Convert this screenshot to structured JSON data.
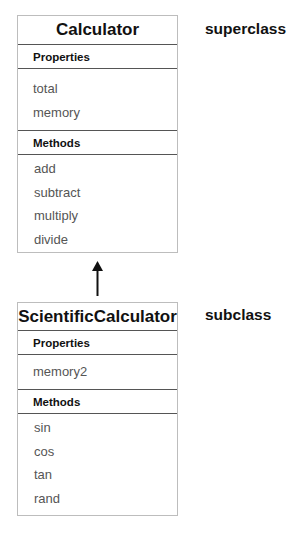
{
  "superclass": {
    "label": "superclass",
    "name": "Calculator",
    "properties_header": "Properties",
    "properties": [
      "total",
      "memory"
    ],
    "methods_header": "Methods",
    "methods": [
      "add",
      "subtract",
      "multiply",
      "divide"
    ]
  },
  "subclass": {
    "label": "subclass",
    "name": "ScientificCalculator",
    "properties_header": "Properties",
    "properties": [
      "memory2"
    ],
    "methods_header": "Methods",
    "methods": [
      "sin",
      "cos",
      "tan",
      "rand"
    ]
  },
  "arrow": {
    "icon": "inheritance-arrow-icon",
    "direction": "up"
  }
}
